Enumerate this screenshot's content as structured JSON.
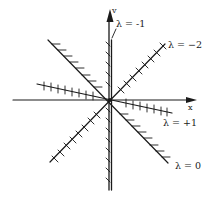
{
  "diagram": {
    "axes": {
      "x_label": "x",
      "y_label": "v"
    },
    "isoclines": [
      {
        "id": "lambda-minus-1",
        "label": "λ = -1",
        "orientation": "vertical"
      },
      {
        "id": "lambda-minus-2",
        "label": "λ = −2",
        "orientation": "rising diagonal"
      },
      {
        "id": "lambda-plus-1",
        "label": "λ = +1",
        "orientation": "shallow falling"
      },
      {
        "id": "lambda-zero",
        "label": "λ = 0",
        "orientation": "falling diagonal"
      }
    ],
    "colors": {
      "ink": "#1a1a1a",
      "background": "#ffffff"
    }
  }
}
